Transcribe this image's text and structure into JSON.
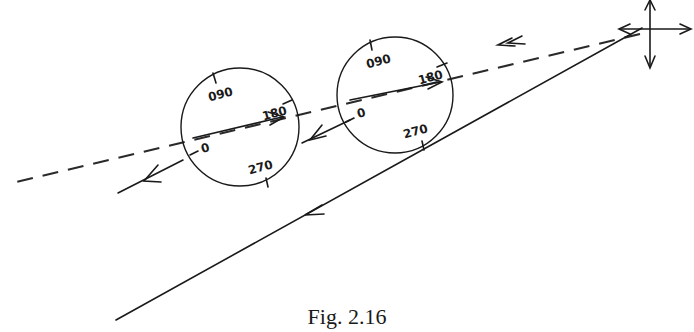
{
  "figure": {
    "caption": "Fig. 2.16",
    "compass_labels": {
      "left": [
        "090",
        "180",
        "0",
        "270"
      ],
      "right": [
        "090",
        "180",
        "0",
        "270"
      ]
    },
    "elements": {
      "dashed_track": "dashed line with arrows",
      "solid_track": "solid line with arrow",
      "cross_arrows": "four-way arrow cross"
    }
  }
}
